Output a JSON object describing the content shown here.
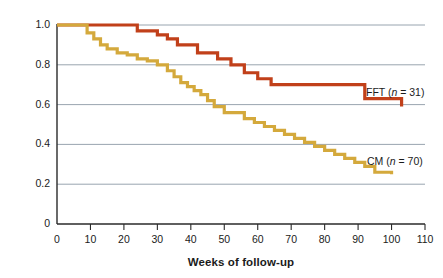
{
  "chart_data": {
    "type": "line",
    "title": "",
    "subtitle": "",
    "xlabel": "Weeks of follow-up",
    "ylabel": "Cumulative survival rate",
    "xlim": [
      0,
      110
    ],
    "ylim": [
      0,
      1.0
    ],
    "grid": "horizontal",
    "legend_position": "inline-right",
    "x_ticks": [
      0,
      10,
      20,
      30,
      40,
      50,
      60,
      70,
      80,
      90,
      100,
      110
    ],
    "x_tick_labels": [
      "0",
      "10",
      "20",
      "30",
      "40",
      "50",
      "60",
      "70",
      "80",
      "90",
      "100",
      "110"
    ],
    "y_ticks": [
      0,
      0.2,
      0.4,
      0.6,
      0.8,
      1.0
    ],
    "y_tick_labels": [
      "0",
      "0.2",
      "0.4",
      "0.6",
      "0.8",
      "1.0"
    ],
    "gridline_values": [
      0.2,
      0.4,
      0.6,
      0.8,
      1.0
    ],
    "step_type": "post",
    "series": [
      {
        "name": "FFT",
        "label_text": "FFT (n = 31)",
        "label_prefix": "FFT (",
        "label_italic": "n",
        "label_suffix": " = 31)",
        "n": 31,
        "color": "#C1401A",
        "x": [
          0,
          21,
          24,
          30,
          33,
          36,
          39,
          42,
          45,
          48,
          52,
          56,
          60,
          64,
          92,
          103
        ],
        "y": [
          1.0,
          1.0,
          0.97,
          0.95,
          0.93,
          0.9,
          0.9,
          0.86,
          0.86,
          0.83,
          0.8,
          0.76,
          0.73,
          0.7,
          0.63,
          0.59
        ],
        "final_value": 0.59
      },
      {
        "name": "CM",
        "label_text": "CM (n = 70)",
        "label_prefix": "CM (",
        "label_italic": "n",
        "label_suffix": " = 70)",
        "n": 70,
        "color": "#D4A93C",
        "x": [
          0,
          7,
          9,
          11,
          13,
          15,
          18,
          21,
          24,
          27,
          30,
          33,
          35,
          37,
          39,
          41,
          43,
          45,
          47,
          50,
          53,
          56,
          59,
          62,
          65,
          68,
          71,
          74,
          77,
          80,
          83,
          86,
          89,
          92,
          95,
          100
        ],
        "y": [
          1.0,
          1.0,
          0.96,
          0.93,
          0.9,
          0.88,
          0.86,
          0.85,
          0.83,
          0.82,
          0.8,
          0.77,
          0.74,
          0.71,
          0.69,
          0.67,
          0.65,
          0.62,
          0.59,
          0.56,
          0.56,
          0.53,
          0.51,
          0.49,
          0.47,
          0.45,
          0.43,
          0.41,
          0.39,
          0.37,
          0.35,
          0.33,
          0.31,
          0.29,
          0.26,
          0.25
        ],
        "final_value": 0.25
      }
    ]
  },
  "colors": {
    "fft": "#C1401A",
    "cm": "#D4A93C",
    "gridline": "#8d9aa6",
    "axis": "#2a2a2a",
    "text": "#1b1b1b",
    "background": "#ffffff"
  }
}
